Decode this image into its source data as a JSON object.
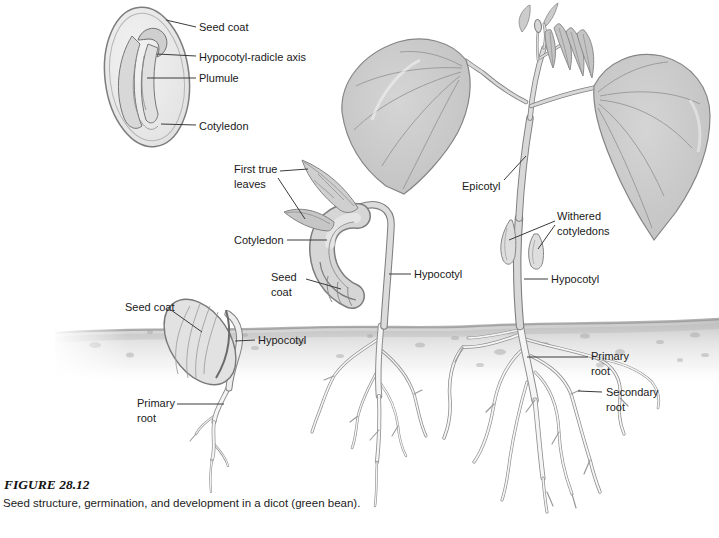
{
  "figure": {
    "label": "FIGURE 28.12",
    "caption": "Seed structure, germination, and development in a dicot (green bean)."
  },
  "labels": {
    "seed_section": {
      "seed_coat": "Seed coat",
      "hypocotyl_radicle_axis": "Hypocotyl-radicle axis",
      "plumule": "Plumule",
      "cotyledon": "Cotyledon"
    },
    "germinating_seed": {
      "seed_coat": "Seed coat",
      "hypocotyl": "Hypocotyl",
      "primary_root": "Primary root"
    },
    "seedling": {
      "first_true_leaves": "First true leaves",
      "cotyledon": "Cotyledon",
      "seed_coat": "Seed coat",
      "hypocotyl": "Hypocotyl"
    },
    "mature_plant": {
      "epicotyl": "Epicotyl",
      "withered_cotyledons": "Withered cotyledons",
      "hypocotyl": "Hypocotyl",
      "primary_root": "Primary root",
      "secondary_root": "Secondary root"
    }
  },
  "palette": {
    "background": "#ffffff",
    "line_art": "#7f7f7f",
    "leaf_fill": "#c7c7c7",
    "stem_fill": "#d8d8d8",
    "root_fill": "#f5f5f5",
    "soil": "#c2c2c2",
    "label_text": "#1a1a1a"
  }
}
